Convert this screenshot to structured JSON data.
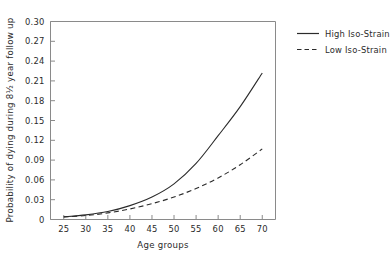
{
  "chart_data": {
    "type": "line",
    "title": "",
    "xlabel": "Age groups",
    "ylabel": "Probability of dying during 8½ year follow up",
    "xlim": [
      22,
      73
    ],
    "ylim": [
      0,
      0.3
    ],
    "grid": false,
    "legend_position": "right-outside",
    "xticks": [
      25,
      30,
      35,
      40,
      45,
      50,
      55,
      60,
      65,
      70
    ],
    "xtick_labels": [
      "25",
      "30",
      "35",
      "40",
      "45",
      "50",
      "55",
      "60",
      "65",
      "70"
    ],
    "yticks": [
      0,
      0.03,
      0.06,
      0.09,
      0.12,
      0.15,
      0.18,
      0.21,
      0.24,
      0.27,
      0.3
    ],
    "ytick_labels": [
      "0",
      "0.03",
      "0.06",
      "0.09",
      "0.12",
      "0.15",
      "0.18",
      "0.21",
      "0.24",
      "0.27",
      "0.30"
    ],
    "x": [
      25,
      30,
      35,
      40,
      45,
      50,
      55,
      60,
      65,
      70
    ],
    "series": [
      {
        "name": "High Iso-Strain",
        "style": "solid",
        "color": "#2b2b2b",
        "values": [
          0.004,
          0.007,
          0.012,
          0.021,
          0.034,
          0.054,
          0.085,
          0.127,
          0.171,
          0.222
        ]
      },
      {
        "name": "Low Iso-Strain",
        "style": "dashed",
        "color": "#2b2b2b",
        "values": [
          0.004,
          0.006,
          0.01,
          0.016,
          0.024,
          0.034,
          0.047,
          0.063,
          0.083,
          0.107
        ]
      }
    ]
  },
  "legend": {
    "entries": [
      {
        "label": "High Iso-Strain",
        "style": "solid"
      },
      {
        "label": "Low Iso-Strain",
        "style": "dashed"
      }
    ]
  },
  "axes": {
    "x_title": "Age groups",
    "y_title": "Probability of dying during 8½ year follow up"
  },
  "colors": {
    "axis": "#8a8a8a",
    "ink": "#2b2b2b",
    "background": "#ffffff"
  }
}
